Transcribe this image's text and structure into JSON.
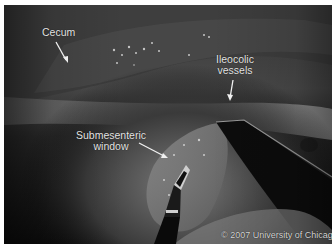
{
  "image": {
    "description": "Grayscale laparoscopic view with annotated anatomy",
    "colors": {
      "background_border": "#ffffff",
      "label_text": "#e6e6e6",
      "arrow": "#f0f0f0"
    }
  },
  "annotations": [
    {
      "id": "cecum",
      "label": "Cecum"
    },
    {
      "id": "ileocolic-vessels",
      "line1": "Ileocolic",
      "line2": "vessels"
    },
    {
      "id": "submesenteric-window",
      "line1": "Submesenteric",
      "line2": "window"
    }
  ],
  "copyright": "© 2007 University of Chicago"
}
